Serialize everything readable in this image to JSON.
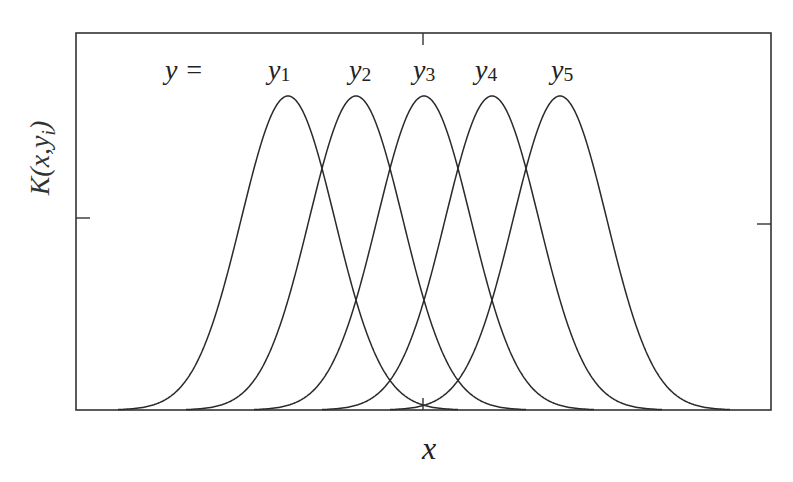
{
  "chart_data": {
    "type": "line",
    "title": "",
    "xlabel": "x",
    "ylabel": "K(x,y_i)",
    "ylabel_parts": {
      "base": "K(x,y",
      "sub": "i",
      "close": ")"
    },
    "legend_prefix": "y =",
    "grid": false,
    "ticks": {
      "x_labels": [],
      "y_labels": []
    },
    "series": [
      {
        "name": "y1",
        "label_base": "y",
        "label_sub": "1",
        "center": -2,
        "shape": "gaussian",
        "peak": 1.0
      },
      {
        "name": "y2",
        "label_base": "y",
        "label_sub": "2",
        "center": -1,
        "shape": "gaussian",
        "peak": 1.0
      },
      {
        "name": "y3",
        "label_base": "y",
        "label_sub": "3",
        "center": 0,
        "shape": "gaussian",
        "peak": 1.0
      },
      {
        "name": "y4",
        "label_base": "y",
        "label_sub": "4",
        "center": 1,
        "shape": "gaussian",
        "peak": 1.0
      },
      {
        "name": "y5",
        "label_base": "y",
        "label_sub": "5",
        "center": 2,
        "shape": "gaussian",
        "peak": 1.0
      }
    ],
    "sigma": 0.69,
    "xlim": [
      -5,
      5
    ],
    "ylim": [
      0,
      1.1
    ],
    "adjacent_crossing_value": 0.77,
    "second_neighbor_crossing_value": 0.35
  },
  "colors": {
    "line": "#2a2a2a",
    "frame": "#333333",
    "background": "#ffffff"
  }
}
